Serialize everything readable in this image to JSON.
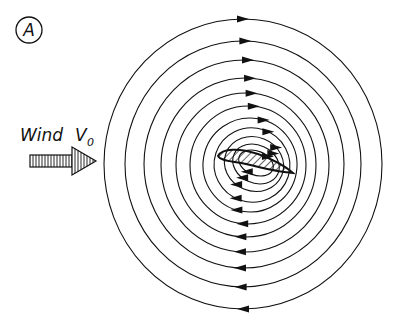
{
  "figure": {
    "panel_label": "A",
    "wind_label": "Wind",
    "velocity_symbol": "V",
    "velocity_subscript": "0",
    "streamline_count": 12,
    "circulation_direction": "clockwise",
    "line_color": "#111111",
    "background_color": "#ffffff"
  }
}
